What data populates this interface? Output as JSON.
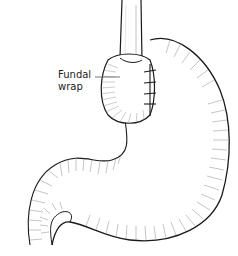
{
  "figure": {
    "labels": [
      {
        "text_line1": "Fundal",
        "text_line2": "wrap"
      }
    ],
    "colors": {
      "ink": "#1a1a1a",
      "hatch": "#8a8a8a",
      "background": "#ffffff"
    }
  }
}
